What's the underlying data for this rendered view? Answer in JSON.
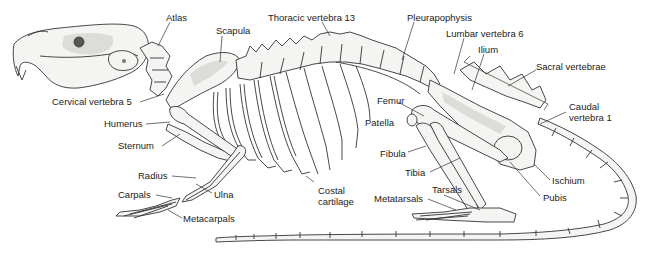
{
  "figure": {
    "labels": [
      {
        "id": "atlas",
        "text": "Atlas",
        "x": 166,
        "y": 12
      },
      {
        "id": "scapula",
        "text": "Scapula",
        "x": 216,
        "y": 25
      },
      {
        "id": "thoracic-vertebra-13",
        "text": "Thoracic vertebra 13",
        "x": 268,
        "y": 12
      },
      {
        "id": "pleurapophysis",
        "text": "Pleurapophysis",
        "x": 407,
        "y": 12
      },
      {
        "id": "lumbar-vertebra-6",
        "text": "Lumbar vertebra 6",
        "x": 446,
        "y": 28
      },
      {
        "id": "ilium",
        "text": "Ilium",
        "x": 478,
        "y": 44
      },
      {
        "id": "sacral-vertebrae",
        "text": "Sacral vertebrae",
        "x": 536,
        "y": 61
      },
      {
        "id": "cervical-vertebra-5",
        "text": "Cervical vertebra 5",
        "x": 52,
        "y": 96
      },
      {
        "id": "femur",
        "text": "Femur",
        "x": 377,
        "y": 95
      },
      {
        "id": "caudal-vertebra-1",
        "text": "Caudal\nvertebra 1",
        "x": 569,
        "y": 101
      },
      {
        "id": "humerus",
        "text": "Humerus",
        "x": 104,
        "y": 118
      },
      {
        "id": "patella",
        "text": "Patella",
        "x": 365,
        "y": 117
      },
      {
        "id": "sternum",
        "text": "Sternum",
        "x": 118,
        "y": 140
      },
      {
        "id": "fibula",
        "text": "Fibula",
        "x": 380,
        "y": 148
      },
      {
        "id": "radius",
        "text": "Radius",
        "x": 138,
        "y": 170
      },
      {
        "id": "tibia",
        "text": "Tibia",
        "x": 405,
        "y": 167
      },
      {
        "id": "ischium",
        "text": "Ischium",
        "x": 552,
        "y": 175
      },
      {
        "id": "costal-cartilage",
        "text": "Costal\ncartilage",
        "x": 318,
        "y": 185
      },
      {
        "id": "carpals",
        "text": "Carpals",
        "x": 118,
        "y": 189
      },
      {
        "id": "ulna",
        "text": "Ulna",
        "x": 214,
        "y": 189
      },
      {
        "id": "tarsals",
        "text": "Tarsals",
        "x": 432,
        "y": 184
      },
      {
        "id": "pubis",
        "text": "Pubis",
        "x": 543,
        "y": 192
      },
      {
        "id": "metatarsals",
        "text": "Metatarsals",
        "x": 374,
        "y": 193
      },
      {
        "id": "metacarpals",
        "text": "Metacarpals",
        "x": 183,
        "y": 213
      }
    ]
  }
}
